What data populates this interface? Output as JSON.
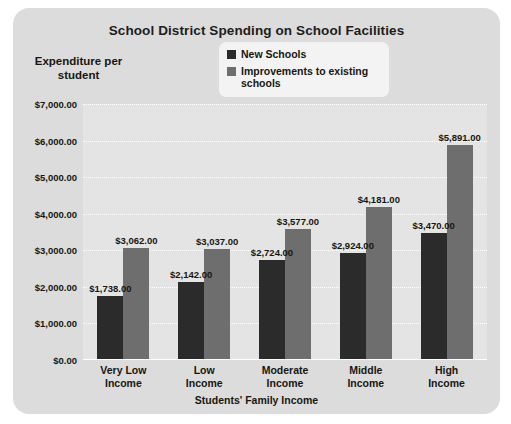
{
  "chart_data": {
    "type": "bar",
    "title": "School District Spending on School Facilities",
    "xlabel": "Students' Family Income",
    "ylabel": "Expenditure per student",
    "categories": [
      "Very Low Income",
      "Low Income",
      "Moderate Income",
      "Middle Income",
      "High Income"
    ],
    "series": [
      {
        "name": "New Schools",
        "color": "#2b2b2b",
        "values": [
          1738,
          2142,
          2724,
          2924,
          3470
        ],
        "labels": [
          "$1,738.00",
          "$2,142.00",
          "$2,724.00",
          "$2,924.00",
          "$3,470.00"
        ]
      },
      {
        "name": "Improvements to existing schools",
        "color": "#6e6e6e",
        "values": [
          3062,
          3037,
          3577,
          4181,
          5891
        ],
        "labels": [
          "$3,062.00",
          "$3,037.00",
          "$3,577.00",
          "$4,181.00",
          "$5,891.00"
        ]
      }
    ],
    "ylim": [
      0,
      7000
    ],
    "ytick_values": [
      0,
      1000,
      2000,
      3000,
      4000,
      5000,
      6000,
      7000
    ],
    "ytick_labels": [
      "$0.00",
      "$1,000.00",
      "$2,000.00",
      "$3,000.00",
      "$4,000.00",
      "$5,000.00",
      "$6,000.00",
      "$7,000.00"
    ],
    "grid": true,
    "legend_position": "top-center",
    "legend_entries": [
      "New Schools",
      "Improvements to existing schools"
    ]
  },
  "legend": {
    "entries": [
      {
        "label": "New Schools"
      },
      {
        "label": "Improvements to existing\nschools"
      }
    ]
  },
  "categories_display": [
    {
      "line1": "Very Low",
      "line2": "Income"
    },
    {
      "line1": "Low",
      "line2": "Income"
    },
    {
      "line1": "Moderate",
      "line2": "Income"
    },
    {
      "line1": "Middle",
      "line2": "Income"
    },
    {
      "line1": "High",
      "line2": "Income"
    }
  ],
  "y_axis_title_lines": {
    "line1": "Expenditure per",
    "line2": "student"
  },
  "colors": {
    "panel_background": "#dcdcdc",
    "plot_background": "#e4e4e4",
    "gridline": "#ffffff",
    "new_schools": "#2b2b2b",
    "improvements": "#6e6e6e",
    "text": "#17170f"
  }
}
